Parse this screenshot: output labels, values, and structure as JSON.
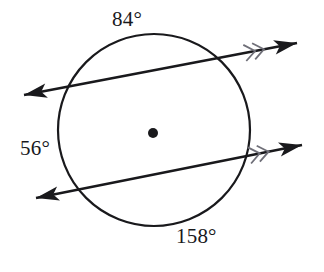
{
  "figure": {
    "kind": "circle-geometry-diagram",
    "width": 324,
    "height": 272,
    "background_color": "#ffffff",
    "stroke_color": "#19191c",
    "tick_color": "#6f6f78"
  },
  "circle": {
    "name": "main-circle",
    "center_x": 154,
    "center_y": 130,
    "radius": 96,
    "stroke_width": 2.2
  },
  "center_point": {
    "name": "circle-center-dot",
    "x": 153,
    "y": 133,
    "radius": 5
  },
  "lines": [
    {
      "id": "upper-secant",
      "label": "upper secant line",
      "x1": 24,
      "y1": 95,
      "x2": 297,
      "y2": 43,
      "arrow_start": true,
      "arrow_end": true,
      "tick_marks": 2,
      "tick_position_t": 0.86,
      "chord_entry_x": 66,
      "chord_entry_y": 87,
      "chord_exit_x": 219,
      "chord_exit_y": 58
    },
    {
      "id": "lower-secant",
      "label": "lower secant line",
      "x1": 36,
      "y1": 198,
      "x2": 302,
      "y2": 145,
      "arrow_start": true,
      "arrow_end": true,
      "tick_marks": 2,
      "tick_position_t": 0.855,
      "chord_entry_x": 77,
      "chord_entry_y": 190,
      "chord_exit_x": 243,
      "chord_exit_y": 157
    }
  ],
  "arc_labels": {
    "top": "84°",
    "left": "56°",
    "bottom": "158°"
  },
  "arc_values": {
    "top_arc_degrees": 84,
    "left_arc_degrees": 56,
    "bottom_arc_degrees": 158
  }
}
